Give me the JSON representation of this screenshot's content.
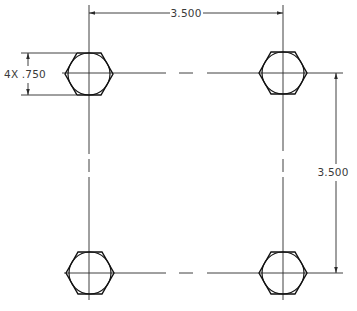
{
  "drawing": {
    "title": "Bolt hole pattern - 4X hex",
    "stroke_color": "#2a2a2a",
    "background": "#ffffff"
  },
  "bolts": [
    {
      "id": "top-left",
      "cx": 89,
      "cy": 74
    },
    {
      "id": "top-right",
      "cx": 283,
      "cy": 73
    },
    {
      "id": "bottom-left",
      "cx": 90,
      "cy": 273
    },
    {
      "id": "bottom-right",
      "cx": 283,
      "cy": 273
    }
  ],
  "hex": {
    "half_width": 24,
    "half_height": 21,
    "inner_radius": 21
  },
  "dimensions": {
    "horizontal": {
      "label": "3.500",
      "x1": 89,
      "x2": 283,
      "y": 13,
      "text_x": 186
    },
    "vertical": {
      "label": "3.500",
      "x": 336,
      "y1": 73,
      "y2": 273,
      "text_x": 331,
      "text_y": 176
    },
    "diameter": {
      "label": "4X .750",
      "x": 28,
      "y1": 53,
      "y2": 95,
      "text_x": 4,
      "text_y": 78,
      "ext_x1": 21,
      "ext_x2": 70
    }
  }
}
